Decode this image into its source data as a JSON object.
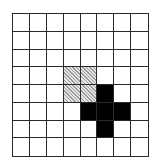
{
  "grid": {
    "rows": 8,
    "cols": 8,
    "line_color": "#2a2a2a",
    "empty_color": "#ffffff",
    "hatched_color": "#b0b0b0",
    "filled_color": "#000000",
    "hatched_cells": [
      [
        3,
        3
      ],
      [
        3,
        4
      ],
      [
        4,
        3
      ],
      [
        4,
        4
      ]
    ],
    "filled_cells": [
      [
        4,
        5
      ],
      [
        5,
        4
      ],
      [
        5,
        5
      ],
      [
        5,
        6
      ],
      [
        6,
        5
      ]
    ]
  }
}
